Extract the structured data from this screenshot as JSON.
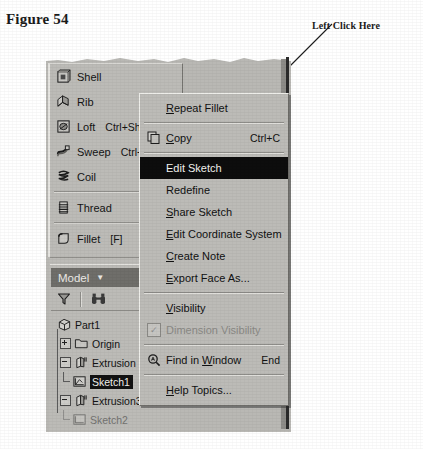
{
  "figure": {
    "caption": "Figure 54"
  },
  "callout": {
    "label": "Left Click Here",
    "target": "Edit Sketch"
  },
  "feature_toolbar": {
    "items": [
      {
        "label": "Shell",
        "accel": "",
        "icon": "shell-icon"
      },
      {
        "label": "Rib",
        "accel": "",
        "icon": "rib-icon"
      },
      {
        "label": "Loft",
        "accel": "Ctrl+Sh",
        "icon": "loft-icon"
      },
      {
        "label": "Sweep",
        "accel": "Ctrl+",
        "icon": "sweep-icon"
      },
      {
        "label": "Coil",
        "accel": "",
        "icon": "coil-icon"
      },
      {
        "label": "Thread",
        "accel": "",
        "icon": "thread-icon"
      },
      {
        "label": "Fillet",
        "accel": "[F]",
        "icon": "fillet-icon"
      },
      {
        "label": "Chamfer",
        "accel": "Ct",
        "icon": "chamfer-icon"
      }
    ]
  },
  "browser": {
    "header_label": "Model",
    "header_caret": "▼",
    "filter_icon": "filter-funnel-icon",
    "find_icon": "binoculars-icon",
    "tree": [
      {
        "label": "Part1",
        "level": 0,
        "state": "none",
        "icon": "part-icon",
        "selected": false
      },
      {
        "label": "Origin",
        "level": 1,
        "state": "collapsed",
        "icon": "folder-icon",
        "selected": false
      },
      {
        "label": "Extrusion",
        "level": 1,
        "state": "expanded",
        "icon": "extrusion-icon",
        "selected": false
      },
      {
        "label": "Sketch1",
        "level": 2,
        "state": "leaf",
        "icon": "sketch-icon",
        "selected": true
      },
      {
        "label": "Extrusion3",
        "level": 1,
        "state": "expanded",
        "icon": "extrusion-icon",
        "selected": false
      },
      {
        "label": "Sketch2",
        "level": 2,
        "state": "leaf",
        "icon": "sketch-icon",
        "selected": false
      }
    ]
  },
  "context_menu": {
    "items": [
      {
        "type": "item",
        "label": "Repeat Fillet",
        "accel": "",
        "icon": "",
        "underline": "R"
      },
      {
        "type": "separator"
      },
      {
        "type": "item",
        "label": "Copy",
        "accel": "Ctrl+C",
        "icon": "copy-icon",
        "underline": "C"
      },
      {
        "type": "separator"
      },
      {
        "type": "highlight",
        "label": "Edit Sketch",
        "accel": "",
        "icon": "",
        "underline": ""
      },
      {
        "type": "item",
        "label": "Redefine",
        "accel": "",
        "icon": "",
        "underline": ""
      },
      {
        "type": "item",
        "label": "Share Sketch",
        "accel": "",
        "icon": "",
        "underline": "S"
      },
      {
        "type": "item",
        "label": "Edit Coordinate System",
        "accel": "",
        "icon": "",
        "underline": "E"
      },
      {
        "type": "item",
        "label": "Create Note",
        "accel": "",
        "icon": "",
        "underline": "C"
      },
      {
        "type": "item",
        "label": "Export Face As...",
        "accel": "",
        "icon": "",
        "underline": "E"
      },
      {
        "type": "separator"
      },
      {
        "type": "item",
        "label": "Visibility",
        "accel": "",
        "icon": "",
        "underline": "V"
      },
      {
        "type": "disabled",
        "label": "Dimension Visibility",
        "accel": "",
        "icon": "checkbox-checked-icon",
        "underline": ""
      },
      {
        "type": "separator"
      },
      {
        "type": "item",
        "label": "Find in Window",
        "accel": "End",
        "icon": "find-icon",
        "underline": "W"
      },
      {
        "type": "separator"
      },
      {
        "type": "item",
        "label": "Help Topics...",
        "accel": "",
        "icon": "",
        "underline": "H"
      }
    ]
  },
  "colors": {
    "panel_face": "#b9b8b4",
    "menu_face": "#bcbbb7",
    "highlight_bg": "#0d0d0d",
    "highlight_fg": "#f4f3ef",
    "header_bg": "#6f6e6a",
    "text": "#111111",
    "disabled_text": "#8a8985",
    "page_bg": "#ffffff"
  }
}
